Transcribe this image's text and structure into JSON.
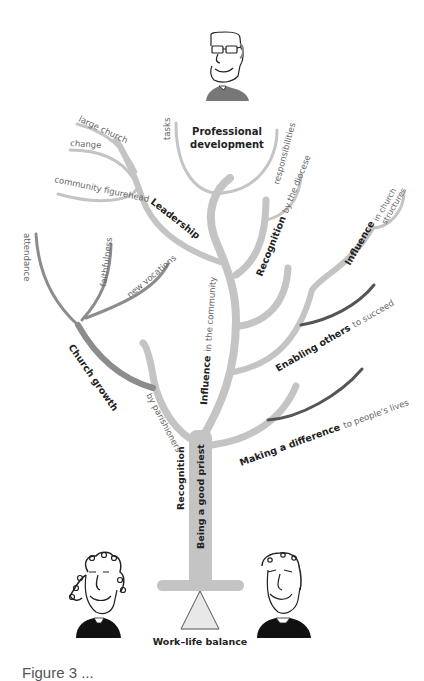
{
  "colors": {
    "branch_light": "#c4c4c4",
    "branch_mid": "#8c8c8c",
    "branch_dark": "#555555",
    "text_bold": "#222222",
    "text_light": "#666666",
    "triangle_fill": "#e8e8e8",
    "triangle_stroke": "#555555"
  },
  "title": {
    "professional_development_line1": "Professional",
    "professional_development_line2": "development"
  },
  "branches": {
    "professional_development": {
      "left": "tasks",
      "right": "responsibilities"
    },
    "leadership": {
      "label": "Leadership",
      "subs": [
        "large church",
        "change",
        "community figurehead"
      ]
    },
    "recognition_diocese": {
      "label_bold": "Recognition",
      "label_light": "by the diocese"
    },
    "influence_church": {
      "label_bold": "Influence",
      "label_light_line1": "in church",
      "label_light_line2": "structures"
    },
    "church_growth": {
      "label": "Church growth",
      "subs": [
        "attendance",
        "faithfulness",
        "new vocations"
      ]
    },
    "influence_community": {
      "label_bold": "Influence",
      "label_light": "in the community"
    },
    "enabling_others": {
      "label_bold": "Enabling others",
      "label_light": "to succeed"
    },
    "making_difference": {
      "label_bold": "Making a difference",
      "label_light": "to people's lives"
    },
    "recognition_parishioners": {
      "label_bold": "Recognition",
      "label_light": "by parishioners"
    }
  },
  "trunk": {
    "label": "Being a good priest"
  },
  "base": {
    "label": "Work–life balance"
  },
  "figures": [
    "priest-top-glasses",
    "priest-bottom-left-curly",
    "priest-bottom-right"
  ],
  "caption": "Figure 3 ..."
}
